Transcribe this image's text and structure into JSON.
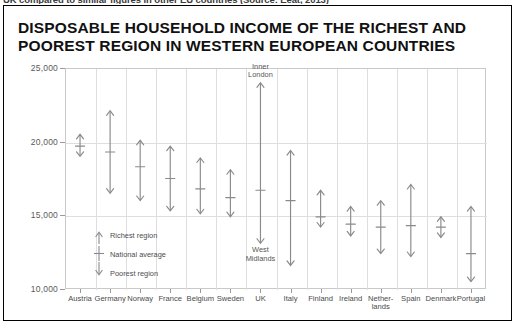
{
  "top_caption": "UK compared to similar figures in other EU countries (Source: Eeat, 2013)",
  "title": {
    "line1": "DISPOSABLE HOUSEHOLD INCOME OF THE RICHEST AND",
    "line2": "POOREST REGION IN WESTERN EUROPEAN COUNTRIES"
  },
  "legend": {
    "richest": "Richest region",
    "average": "National average",
    "poorest": "Poorest region"
  },
  "annotations": {
    "uk_top": "Inner\nLondon",
    "uk_bottom": "West\nMidlands"
  },
  "colors": {
    "arrow": "#8a8a8a",
    "grid": "#dedede",
    "frame": "#c9c9c9",
    "text": "#4a4a4a",
    "title": "#111111"
  },
  "chart_data": {
    "type": "line",
    "title": "DISPOSABLE HOUSEHOLD INCOME OF THE RICHEST AND POOREST REGION IN WESTERN EUROPEAN COUNTRIES",
    "xlabel": "",
    "ylabel": "",
    "ylim": [
      10000,
      25000
    ],
    "yticks": [
      10000,
      15000,
      20000,
      25000
    ],
    "ytick_labels": [
      "10,000",
      "15,000",
      "20,000",
      "25,000"
    ],
    "grid": true,
    "legend_position": "inside-lower-left",
    "categories": [
      "Austria",
      "Germany",
      "Norway",
      "France",
      "Belgium",
      "Sweden",
      "UK",
      "Italy",
      "Finland",
      "Ireland",
      "Netherlands",
      "Spain",
      "Denmark",
      "Portugal"
    ],
    "category_labels": [
      "Austria",
      "Germany",
      "Norway",
      "France",
      "Belgium",
      "Sweden",
      "UK",
      "Italy",
      "Finland",
      "Ireland",
      "Nether-\nlands",
      "Spain",
      "Denmark",
      "Portugal"
    ],
    "series": [
      {
        "name": "Richest region",
        "values": [
          20500,
          22100,
          20100,
          19700,
          18900,
          18100,
          24000,
          19400,
          16700,
          15600,
          16000,
          17100,
          14900,
          15600
        ]
      },
      {
        "name": "National average",
        "values": [
          19700,
          19300,
          18300,
          17500,
          16800,
          16200,
          16700,
          16000,
          14900,
          14400,
          14200,
          14300,
          14200,
          12400
        ]
      },
      {
        "name": "Poorest region",
        "values": [
          19000,
          16500,
          16000,
          15300,
          15100,
          14900,
          13100,
          11600,
          14200,
          13600,
          12400,
          12200,
          13500,
          10500
        ]
      }
    ]
  }
}
